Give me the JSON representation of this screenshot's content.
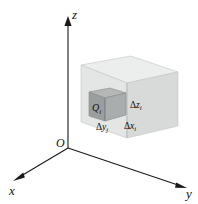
{
  "figure": {
    "background_color": "#ffffff",
    "axes": {
      "origin_label": "O",
      "x_label": "x",
      "y_label": "y",
      "z_label": "z",
      "axis_color": "#1a1a1a"
    },
    "big_cube": {
      "name": "outer-cube",
      "top_face_color": "#eceded",
      "left_face_color": "#e2e3e3",
      "right_face_color": "#d7d8d8",
      "edge_color": "#b9bcbc"
    },
    "small_cube": {
      "name": "element-cube",
      "label": "Q",
      "label_subscript": "i",
      "top_face_color": "#b4b6b6",
      "left_face_color": "#9a9d9d",
      "right_face_color": "#a9acac",
      "edge_color": "#7d8080"
    },
    "dimension_labels": [
      {
        "id": "dz",
        "delta": "Δ",
        "var": "z",
        "sub": "i"
      },
      {
        "id": "dy",
        "delta": "Δ",
        "var": "y",
        "sub": "j"
      },
      {
        "id": "dx",
        "delta": "Δ",
        "var": "x",
        "sub": "i"
      }
    ]
  }
}
